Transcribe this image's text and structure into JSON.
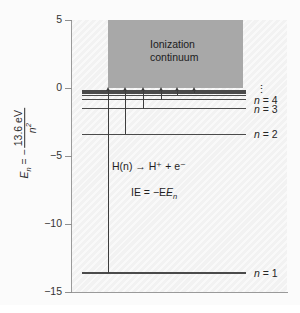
{
  "figure": {
    "width": 300,
    "height": 313,
    "background": "#ffffff",
    "plot_background": "#f2f2f2",
    "continuum_color": "#a8a8a8",
    "line_color": "#4a4a4a",
    "axis_color": "#9a9a9a"
  },
  "axis": {
    "y_title_prefix": "E",
    "y_title_sub": "n",
    "y_title_eq": " = −",
    "y_title_numerator": "13.6 eV",
    "y_title_denominator": "n",
    "y_title_denominator_exp": "2",
    "ticks": [
      {
        "value": 5,
        "label": "5"
      },
      {
        "value": 0,
        "label": "0"
      },
      {
        "value": -5,
        "label": "−5"
      },
      {
        "value": -10,
        "label": "−10"
      },
      {
        "value": -15,
        "label": "−15"
      }
    ],
    "ymin": -15,
    "ymax": 5
  },
  "continuum": {
    "label_line1": "Ionization",
    "label_line2": "continuum",
    "energy_bottom": 0,
    "energy_top": 5
  },
  "levels": [
    {
      "n": 1,
      "energy": -13.6,
      "label": "n = 1",
      "show_label": true
    },
    {
      "n": 2,
      "energy": -3.4,
      "label": "n = 2",
      "show_label": true
    },
    {
      "n": 3,
      "energy": -1.51,
      "label": "n = 3",
      "show_label": true
    },
    {
      "n": 4,
      "energy": -0.85,
      "label": "n = 4",
      "show_label": true
    },
    {
      "n": 5,
      "energy": -0.54,
      "label": "n = 5",
      "show_label": false
    },
    {
      "n": 6,
      "energy": -0.38,
      "label": "n = 6",
      "show_label": false
    },
    {
      "n": 7,
      "energy": -0.28,
      "label": "n = 7",
      "show_label": false
    },
    {
      "n": 8,
      "energy": -0.21,
      "label": "n = 8",
      "show_label": false
    }
  ],
  "series_limit_label": "⋮",
  "transitions": [
    {
      "from_energy": -13.6,
      "to_energy": 0.0,
      "x_frac": 0.16
    },
    {
      "from_energy": -3.4,
      "to_energy": 0.0,
      "x_frac": 0.26
    },
    {
      "from_energy": -1.51,
      "to_energy": 0.0,
      "x_frac": 0.37
    },
    {
      "from_energy": -0.85,
      "to_energy": 0.0,
      "x_frac": 0.48
    },
    {
      "from_energy": -0.54,
      "to_energy": 0.0,
      "x_frac": 0.58
    },
    {
      "from_energy": -0.38,
      "to_energy": 0.0,
      "x_frac": 0.68
    }
  ],
  "annotations": {
    "reaction": "H(n) → H⁺ + e⁻",
    "ionization_energy": "IE = −E",
    "ionization_energy_sub": "n"
  },
  "chart_data": {
    "type": "line",
    "xlabel": "",
    "ylabel": "E_n = -13.6 eV / n^2",
    "ylim": [
      -15,
      5
    ],
    "grid": false,
    "legend": "none",
    "categories": [
      "n = 1",
      "n = 2",
      "n = 3",
      "n = 4",
      "n = 5",
      "n = 6",
      "n = 7",
      "n = 8"
    ],
    "values": [
      -13.6,
      -3.4,
      -1.51,
      -0.85,
      -0.54,
      -0.38,
      -0.28,
      -0.21
    ],
    "ytick_labels": [
      "5",
      "0",
      "−5",
      "−10",
      "−15"
    ],
    "ytick_values": [
      5,
      0,
      -5,
      -10,
      -15
    ],
    "annotations": [
      "Ionization continuum",
      "H(n) → H⁺ + e⁻",
      "IE = −E_n",
      "⋮"
    ],
    "shaded_region": {
      "label": "Ionization continuum",
      "y_from": 0,
      "y_to": 5
    }
  }
}
